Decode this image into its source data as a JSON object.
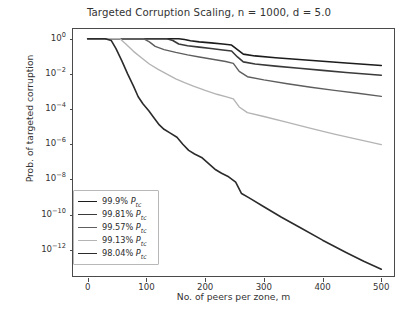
{
  "chart_data": {
    "type": "line",
    "title": "Targeted Corruption Scaling, n = 1000, d = 5.0",
    "xlabel": "No. of peers per zone, m",
    "ylabel": "Prob. of targeted corruption",
    "xlim": [
      -25,
      525
    ],
    "ylim_log10": [
      -13.6,
      0.55
    ],
    "xticks": [
      0,
      100,
      200,
      300,
      400,
      500
    ],
    "xtick_labels": [
      "0",
      "100",
      "200",
      "300",
      "400",
      "500"
    ],
    "yticks_log10": [
      0,
      -2,
      -4,
      -6,
      -8,
      -10,
      -12
    ],
    "ytick_labels": [
      "10^0",
      "10^-2",
      "10^-4",
      "10^-6",
      "10^-8",
      "10^-10",
      "10^-12"
    ],
    "grid": false,
    "legend_position": "lower left",
    "scale": "semilogy",
    "series": [
      {
        "name": "99.9% P_tc",
        "label_value": "99.9%",
        "label_symbol": "P",
        "label_subscript": "tc",
        "color": "#1c1c1c",
        "linewidth": 1.6,
        "x": [
          0,
          20,
          40,
          60,
          80,
          100,
          120,
          140,
          155,
          165,
          175,
          190,
          210,
          230,
          245,
          255,
          265,
          285,
          320,
          360,
          400,
          440,
          500
        ],
        "y_log10": [
          0,
          0,
          0,
          0,
          0,
          0,
          0,
          0,
          0,
          -0.05,
          -0.12,
          -0.18,
          -0.24,
          -0.3,
          -0.36,
          -0.62,
          -0.88,
          -0.98,
          -1.08,
          -1.18,
          -1.28,
          -1.38,
          -1.52
        ]
      },
      {
        "name": "99.81% P_tc",
        "label_value": "99.81%",
        "label_symbol": "P",
        "label_subscript": "tc",
        "color": "#3a3a3a",
        "linewidth": 1.6,
        "x": [
          0,
          20,
          40,
          60,
          80,
          100,
          120,
          135,
          145,
          155,
          170,
          190,
          210,
          230,
          245,
          255,
          265,
          285,
          320,
          360,
          400,
          440,
          500
        ],
        "y_log10": [
          0,
          0,
          0,
          0,
          0,
          0,
          0,
          0,
          -0.1,
          -0.3,
          -0.4,
          -0.48,
          -0.56,
          -0.64,
          -0.7,
          -1.04,
          -1.32,
          -1.44,
          -1.56,
          -1.68,
          -1.8,
          -1.92,
          -2.08
        ]
      },
      {
        "name": "99.57% P_tc",
        "label_value": "99.57%",
        "label_symbol": "P",
        "label_subscript": "tc",
        "color": "#5e5e5e",
        "linewidth": 1.4,
        "x": [
          0,
          20,
          40,
          60,
          80,
          95,
          105,
          115,
          130,
          150,
          170,
          190,
          215,
          235,
          248,
          258,
          272,
          300,
          340,
          380,
          420,
          460,
          500
        ],
        "y_log10": [
          0,
          0,
          0,
          0,
          0,
          0,
          -0.18,
          -0.44,
          -0.62,
          -0.78,
          -0.92,
          -1.04,
          -1.18,
          -1.3,
          -1.4,
          -1.86,
          -2.16,
          -2.34,
          -2.56,
          -2.76,
          -2.94,
          -3.1,
          -3.28
        ]
      },
      {
        "name": "99.13% P_tc",
        "label_value": "99.13%",
        "label_symbol": "P",
        "label_subscript": "tc",
        "color": "#b4b4b4",
        "linewidth": 1.4,
        "x": [
          0,
          20,
          40,
          55,
          65,
          78,
          92,
          105,
          120,
          135,
          150,
          165,
          180,
          200,
          220,
          238,
          248,
          258,
          272,
          300,
          340,
          380,
          420,
          460,
          500
        ],
        "y_log10": [
          0,
          0,
          0,
          0,
          -0.3,
          -0.72,
          -1.1,
          -1.44,
          -1.74,
          -2.02,
          -2.28,
          -2.5,
          -2.7,
          -2.94,
          -3.16,
          -3.32,
          -3.42,
          -3.88,
          -4.2,
          -4.42,
          -4.76,
          -5.1,
          -5.42,
          -5.72,
          -6.02
        ]
      },
      {
        "name": "98.04% P_tc",
        "label_value": "98.04%",
        "label_symbol": "P",
        "label_subscript": "tc",
        "color": "#2b2b2b",
        "linewidth": 1.6,
        "x": [
          0,
          15,
          30,
          40,
          48,
          58,
          68,
          78,
          86,
          94,
          104,
          114,
          122,
          130,
          140,
          152,
          162,
          172,
          182,
          194,
          206,
          218,
          228,
          240,
          252,
          262,
          275,
          300,
          330,
          360,
          400,
          440,
          470,
          500
        ],
        "y_log10": [
          0,
          0,
          0,
          -0.1,
          -0.55,
          -1.25,
          -2.0,
          -2.7,
          -3.3,
          -3.7,
          -4.1,
          -4.55,
          -4.9,
          -5.15,
          -5.35,
          -5.6,
          -6.0,
          -6.35,
          -6.55,
          -6.75,
          -7.1,
          -7.45,
          -7.65,
          -7.85,
          -8.15,
          -8.8,
          -9.05,
          -9.55,
          -10.15,
          -10.7,
          -11.45,
          -12.15,
          -12.65,
          -13.1
        ]
      }
    ]
  }
}
